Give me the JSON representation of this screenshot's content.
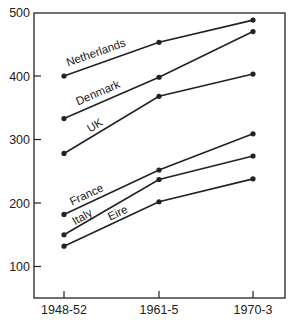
{
  "chart_data": {
    "type": "line",
    "title": "",
    "xlabel": "",
    "ylabel": "",
    "categories": [
      "1948-52",
      "1961-5",
      "1970-3"
    ],
    "ylim": [
      55,
      500
    ],
    "yticks": [
      100,
      200,
      300,
      400,
      500
    ],
    "grid": false,
    "legend": "inline labels on lines",
    "series": [
      {
        "name": "Netherlands",
        "values": [
          400,
          453,
          488
        ]
      },
      {
        "name": "Denmark",
        "values": [
          333,
          398,
          470
        ]
      },
      {
        "name": "UK",
        "values": [
          278,
          368,
          403
        ]
      },
      {
        "name": "France",
        "values": [
          182,
          252,
          309
        ]
      },
      {
        "name": "Italy",
        "values": [
          150,
          237,
          274
        ]
      },
      {
        "name": "Eire",
        "values": [
          132,
          202,
          238
        ]
      }
    ]
  }
}
